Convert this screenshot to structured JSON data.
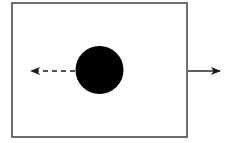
{
  "diagram": {
    "type": "physics-sketch",
    "colors": {
      "background": "#ffffff",
      "box_stroke": "#4a4a4a",
      "ball_fill": "#000000",
      "arrow": "#1a1a1a"
    },
    "box": {
      "x": 12,
      "y": 3,
      "width": 175,
      "height": 134
    },
    "ball": {
      "cx": 99.5,
      "cy": 70,
      "r": 24
    },
    "left_arrow": {
      "style": "dashed",
      "x1": 75,
      "y1": 71,
      "x2": 30,
      "y2": 71,
      "direction": "left"
    },
    "right_arrow": {
      "style": "solid",
      "x1": 188,
      "y1": 71,
      "x2": 221,
      "y2": 71,
      "direction": "right"
    }
  }
}
